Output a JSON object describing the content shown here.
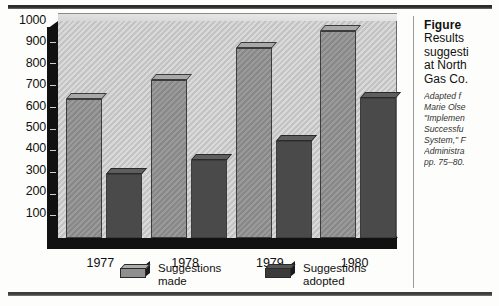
{
  "chart_data": {
    "type": "bar",
    "xlabel": "",
    "ylabel": "",
    "categories": [
      "1977",
      "1978",
      "1979",
      "1980"
    ],
    "series": [
      {
        "name": "Suggestions made",
        "values": [
          640,
          730,
          875,
          955
        ],
        "color": "#8f8f8f"
      },
      {
        "name": "Suggestions adopted",
        "values": [
          295,
          360,
          445,
          645
        ],
        "color": "#4a4a4a"
      }
    ],
    "ylim": [
      0,
      1000
    ],
    "yticks": [
      1000,
      900,
      800,
      700,
      600,
      500,
      400,
      300,
      200,
      100
    ],
    "grid": false,
    "legend_position": "bottom",
    "style": "3d-bar"
  },
  "axis": {
    "y_tick_labels": [
      "1000",
      "900",
      "800",
      "700",
      "600",
      "500",
      "400",
      "300",
      "200",
      "100"
    ],
    "x_tick_labels": [
      "1977",
      "1978",
      "1979",
      "1980"
    ]
  },
  "legend": {
    "items": [
      {
        "label_line1": "Suggestions",
        "label_line2": "made",
        "swatch": "light-gray-3d-block"
      },
      {
        "label_line1": "Suggestions",
        "label_line2": "adopted",
        "swatch": "dark-gray-3d-block"
      }
    ]
  },
  "caption": {
    "figure_label": "Figure",
    "lines": [
      "Results",
      "suggesti",
      "at North",
      "Gas Co."
    ],
    "source_lines": [
      "Adapted f",
      "Marie Olse",
      "\"Implemen",
      "Successfu",
      "System,\" F",
      "Administra",
      "pp. 75–80."
    ]
  }
}
